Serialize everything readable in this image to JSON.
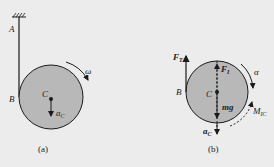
{
  "figure_a": {
    "caption": "(a)",
    "labels": {
      "A": "A",
      "B": "B",
      "C": "C",
      "omega": "ω",
      "aC": "a",
      "aC_sub": "C"
    }
  },
  "figure_b": {
    "caption": "(b)",
    "labels": {
      "FT": "F",
      "FT_sub": "T",
      "B": "B",
      "C": "C",
      "F1": "F",
      "F1_sub": "I",
      "mg": "mg",
      "alpha": "α",
      "aC": "a",
      "aC_sub": "C",
      "MIC": "M",
      "MIC_sub": "IC"
    }
  },
  "colors": {
    "disk_fill": "#b8b8b8",
    "stroke": "#1a1a1a",
    "background": "#ececec"
  }
}
